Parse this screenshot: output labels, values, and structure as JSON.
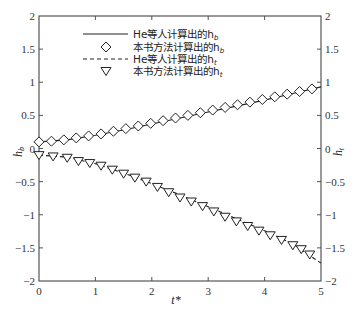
{
  "chart_data": {
    "type": "line",
    "title": "",
    "xlabel": "t*",
    "ylabel_left": "h_b",
    "ylabel_right": "h_t",
    "xlim": [
      0,
      5
    ],
    "ylim_left": [
      -2,
      2
    ],
    "ylim_right": [
      -2,
      2
    ],
    "x_ticks": [
      "0",
      "1",
      "2",
      "3",
      "4",
      "5"
    ],
    "y_ticks_left": [
      "2",
      "1.5",
      "1",
      "0.5",
      "0",
      "-0.5",
      "-1",
      "-1.5",
      "-2"
    ],
    "y_ticks_right": [
      "2",
      "1.5",
      "1",
      "0.5",
      "0",
      "-0.5",
      "-1",
      "-1.5",
      "-2"
    ],
    "grid": false,
    "legend_position": "upper center",
    "legend": [
      {
        "label": "He等人计算出的h_b",
        "style": "solid-line"
      },
      {
        "label": "本书方法计算出的h_b",
        "style": "diamond-marker"
      },
      {
        "label": "He等人计算出的h_t",
        "style": "dashed-line"
      },
      {
        "label": "本书方法计算出的h_t",
        "style": "triangle-down-marker"
      }
    ],
    "series": [
      {
        "name": "He等人计算出的h_b",
        "style": "solid",
        "x": [
          0,
          0.5,
          1,
          1.5,
          2,
          2.5,
          3,
          3.5,
          4,
          4.5,
          5
        ],
        "values": [
          0.1,
          0.13,
          0.2,
          0.28,
          0.37,
          0.46,
          0.55,
          0.64,
          0.73,
          0.83,
          0.93
        ]
      },
      {
        "name": "本书方法计算出的h_b",
        "style": "diamond",
        "x": [
          0,
          0.22,
          0.44,
          0.66,
          0.88,
          1.1,
          1.32,
          1.54,
          1.76,
          1.98,
          2.2,
          2.42,
          2.64,
          2.86,
          3.08,
          3.3,
          3.52,
          3.74,
          3.96,
          4.18,
          4.4,
          4.62,
          4.84
        ],
        "values": [
          0.1,
          0.11,
          0.13,
          0.16,
          0.19,
          0.22,
          0.26,
          0.3,
          0.34,
          0.38,
          0.42,
          0.46,
          0.5,
          0.54,
          0.58,
          0.62,
          0.66,
          0.7,
          0.74,
          0.78,
          0.82,
          0.86,
          0.9
        ]
      },
      {
        "name": "He等人计算出的h_t",
        "style": "dashed",
        "x": [
          0,
          0.5,
          1,
          1.5,
          2,
          2.5,
          3,
          3.5,
          4,
          4.5,
          5
        ],
        "values": [
          -0.1,
          -0.13,
          -0.23,
          -0.37,
          -0.53,
          -0.7,
          -0.88,
          -1.06,
          -1.24,
          -1.44,
          -1.73
        ]
      },
      {
        "name": "本书方法计算出的h_t",
        "style": "triangle-down",
        "x": [
          0,
          0.25,
          0.5,
          0.7,
          0.9,
          1.1,
          1.3,
          1.5,
          1.7,
          1.9,
          2.1,
          2.3,
          2.5,
          2.7,
          2.9,
          3.1,
          3.3,
          3.5,
          3.7,
          3.9,
          4.1,
          4.3,
          4.5,
          4.65,
          4.8
        ],
        "values": [
          -0.1,
          -0.12,
          -0.14,
          -0.19,
          -0.22,
          -0.26,
          -0.32,
          -0.38,
          -0.44,
          -0.5,
          -0.58,
          -0.66,
          -0.74,
          -0.8,
          -0.87,
          -0.95,
          -1.03,
          -1.1,
          -1.17,
          -1.24,
          -1.31,
          -1.38,
          -1.46,
          -1.52,
          -1.6
        ]
      }
    ]
  }
}
